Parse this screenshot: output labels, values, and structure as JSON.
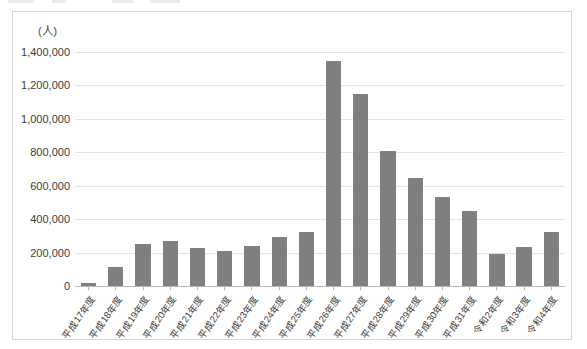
{
  "chart_data": {
    "type": "bar",
    "title": "",
    "subtitle": "",
    "unit_label": "(人)",
    "xlabel": "",
    "ylabel": "",
    "ylim": [
      0,
      1400000
    ],
    "y_ticks": [
      0,
      200000,
      400000,
      600000,
      800000,
      1000000,
      1200000,
      1400000
    ],
    "y_tick_labels": [
      "0",
      "200,000",
      "400,000",
      "600,000",
      "800,000",
      "1,000,000",
      "1,200,000",
      "1,400,000"
    ],
    "grid": true,
    "legend": "none",
    "series_color": "#7f7f7f",
    "categories": [
      "平成17年度",
      "平成18年度",
      "平成19年度",
      "平成20年度",
      "平成21年度",
      "平成22年度",
      "平成23年度",
      "平成24年度",
      "平成25年度",
      "平成26年度",
      "平成27年度",
      "平成28年度",
      "平成29年度",
      "平成30年度",
      "平成31年度",
      "令和2年度",
      "令和3年度",
      "令和4年度"
    ],
    "values": [
      20000,
      115000,
      250000,
      268000,
      228000,
      208000,
      238000,
      293000,
      322000,
      1348000,
      1150000,
      805000,
      645000,
      530000,
      450000,
      190000,
      235000,
      325000
    ]
  }
}
